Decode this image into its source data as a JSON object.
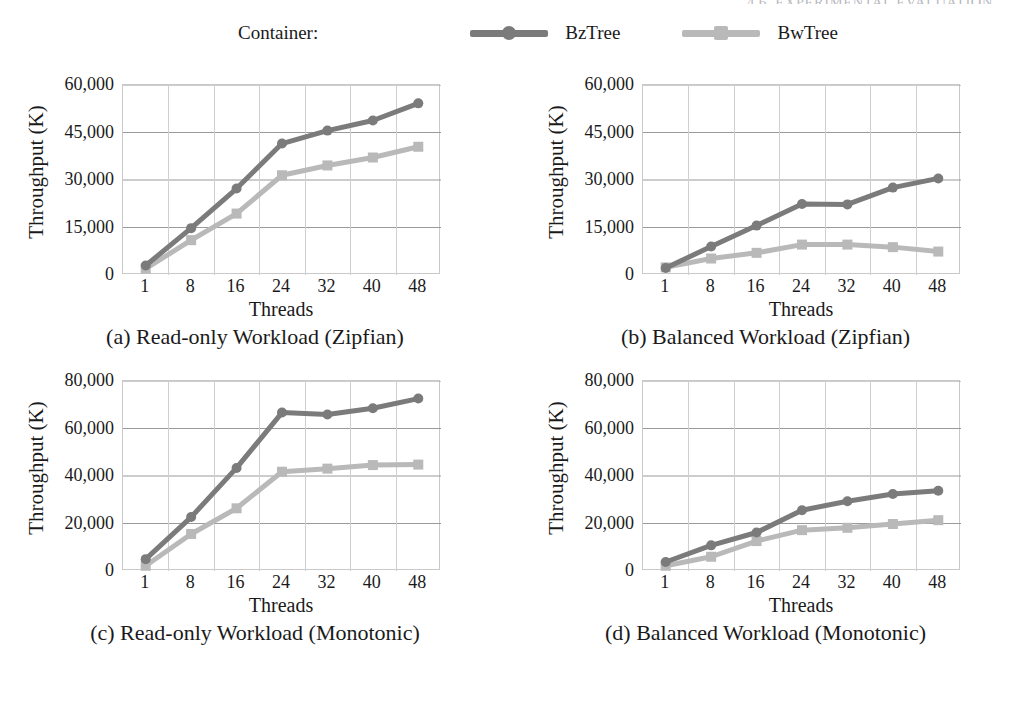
{
  "running_head": "4.6. EXPERIMENTAL EVALUATION",
  "legend": {
    "title": "Container:",
    "items": [
      {
        "label": "BzTree",
        "color": "#7b7b7b",
        "marker": "circle"
      },
      {
        "label": "BwTree",
        "color": "#b9b9b9",
        "marker": "square"
      }
    ]
  },
  "chart_data": [
    {
      "id": "a",
      "type": "line",
      "title": "",
      "caption": "(a) Read-only Workload (Zipfian)",
      "xlabel": "Threads",
      "ylabel": "Throughput (K)",
      "x": [
        1,
        8,
        16,
        24,
        32,
        40,
        48
      ],
      "xticklabels": [
        "1",
        "8",
        "16",
        "24",
        "32",
        "40",
        "48"
      ],
      "yticklabels": [
        "0",
        "15,000",
        "30,000",
        "45,000",
        "60,000"
      ],
      "yticks": [
        0,
        15000,
        30000,
        45000,
        60000
      ],
      "ylim": [
        0,
        60000
      ],
      "grid": true,
      "legend_position": "top",
      "series": [
        {
          "name": "BzTree",
          "color": "#7b7b7b",
          "marker": "circle",
          "values": [
            3000,
            14800,
            27300,
            41500,
            45600,
            48800,
            54200
          ]
        },
        {
          "name": "BwTree",
          "color": "#b9b9b9",
          "marker": "square",
          "values": [
            2000,
            11000,
            19400,
            31500,
            34600,
            37100,
            40500
          ]
        }
      ]
    },
    {
      "id": "b",
      "type": "line",
      "title": "",
      "caption": "(b) Balanced Workload (Zipfian)",
      "xlabel": "Threads",
      "ylabel": "Throughput (K)",
      "x": [
        1,
        8,
        16,
        24,
        32,
        40,
        48
      ],
      "xticklabels": [
        "1",
        "8",
        "16",
        "24",
        "32",
        "40",
        "48"
      ],
      "yticklabels": [
        "0",
        "15,000",
        "30,000",
        "45,000",
        "60,000"
      ],
      "yticks": [
        0,
        15000,
        30000,
        45000,
        60000
      ],
      "ylim": [
        0,
        60000
      ],
      "grid": true,
      "legend_position": "top",
      "series": [
        {
          "name": "BzTree",
          "color": "#7b7b7b",
          "marker": "circle",
          "values": [
            2200,
            9000,
            15600,
            22400,
            22300,
            27600,
            30500
          ]
        },
        {
          "name": "BwTree",
          "color": "#b9b9b9",
          "marker": "square",
          "values": [
            2400,
            5200,
            7000,
            9600,
            9600,
            8800,
            7400
          ]
        }
      ]
    },
    {
      "id": "c",
      "type": "line",
      "title": "",
      "caption": "(c) Read-only Workload (Monotonic)",
      "xlabel": "Threads",
      "ylabel": "Throughput (K)",
      "x": [
        1,
        8,
        16,
        24,
        32,
        40,
        48
      ],
      "xticklabels": [
        "1",
        "8",
        "16",
        "24",
        "32",
        "40",
        "48"
      ],
      "yticklabels": [
        "0",
        "20,000",
        "40,000",
        "60,000",
        "80,000"
      ],
      "yticks": [
        0,
        20000,
        40000,
        60000,
        80000
      ],
      "ylim": [
        0,
        80000
      ],
      "grid": true,
      "legend_position": "top",
      "series": [
        {
          "name": "BzTree",
          "color": "#7b7b7b",
          "marker": "circle",
          "values": [
            5000,
            22700,
            43400,
            66700,
            65900,
            68500,
            72600
          ]
        },
        {
          "name": "BwTree",
          "color": "#b9b9b9",
          "marker": "square",
          "values": [
            2200,
            15600,
            26400,
            41800,
            43100,
            44600,
            44800
          ]
        }
      ]
    },
    {
      "id": "d",
      "type": "line",
      "title": "",
      "caption": "(d) Balanced Workload (Monotonic)",
      "xlabel": "Threads",
      "ylabel": "Throughput (K)",
      "x": [
        1,
        8,
        16,
        24,
        32,
        40,
        48
      ],
      "xticklabels": [
        "1",
        "8",
        "16",
        "24",
        "32",
        "40",
        "48"
      ],
      "yticklabels": [
        "0",
        "20,000",
        "40,000",
        "60,000",
        "80,000"
      ],
      "yticks": [
        0,
        20000,
        40000,
        60000,
        80000
      ],
      "ylim": [
        0,
        80000
      ],
      "grid": true,
      "legend_position": "top",
      "series": [
        {
          "name": "BzTree",
          "color": "#7b7b7b",
          "marker": "circle",
          "values": [
            3800,
            10800,
            16200,
            25600,
            29400,
            32400,
            33800
          ]
        },
        {
          "name": "BwTree",
          "color": "#b9b9b9",
          "marker": "square",
          "values": [
            2200,
            6000,
            12600,
            17200,
            18200,
            19800,
            21400
          ]
        }
      ]
    }
  ]
}
